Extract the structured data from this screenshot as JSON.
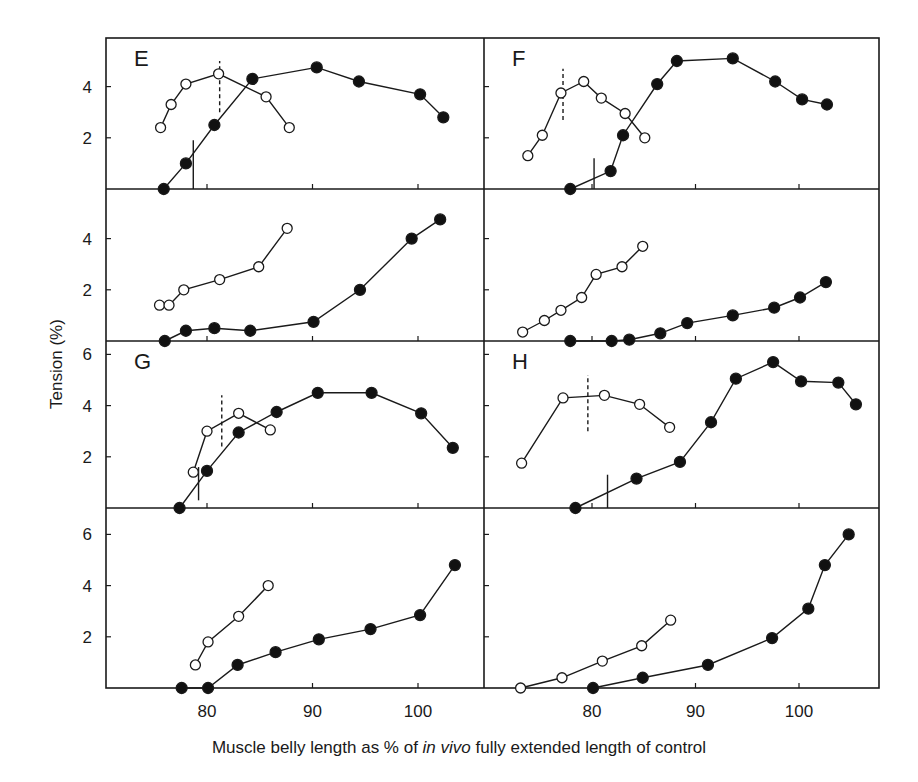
{
  "figure": {
    "ylabel": "Tension (%)",
    "xlabel_parts": [
      "Muscle belly length as % of ",
      "in vivo",
      " fully extended length of control"
    ],
    "x_ticks": [
      "80",
      "90",
      "100"
    ],
    "colors": {
      "ink": "#1a1a1a",
      "background": "#ffffff",
      "open_marker_fill": "#ffffff",
      "filled_marker_fill": "#111111"
    }
  },
  "chart_data": [
    {
      "type": "line",
      "panel": "E",
      "row": 1,
      "col": 1,
      "title": "E",
      "xlabel": "",
      "ylabel": "Tension (%)",
      "xlim": [
        70.5,
        106
      ],
      "ylim": [
        0,
        5.9
      ],
      "y_ticks": [
        2,
        4
      ],
      "x_ticks": [
        80,
        90,
        100
      ],
      "series": [
        {
          "name": "open",
          "marker": "open-circle",
          "x": [
            75.6,
            76.6,
            78.0,
            81.1,
            85.6,
            87.8
          ],
          "y": [
            2.4,
            3.3,
            4.1,
            4.5,
            3.6,
            2.4
          ]
        },
        {
          "name": "filled",
          "marker": "filled-circle",
          "x": [
            75.9,
            78.0,
            80.7,
            84.3,
            90.4,
            94.4,
            100.2,
            102.4
          ],
          "y": [
            0,
            1.0,
            2.5,
            4.3,
            4.75,
            4.2,
            3.7,
            2.8
          ]
        }
      ],
      "markers": [
        {
          "style": "solid",
          "x": 78.7,
          "y": [
            0.0,
            1.9
          ]
        },
        {
          "style": "dashed",
          "x": 81.2,
          "y": [
            3.0,
            5.0
          ]
        }
      ]
    },
    {
      "type": "line",
      "panel": "F",
      "row": 1,
      "col": 2,
      "title": "F",
      "xlabel": "",
      "ylabel": "",
      "xlim": [
        70.9,
        108.2
      ],
      "ylim": [
        0,
        5.9
      ],
      "y_ticks": [
        2,
        4
      ],
      "x_ticks": [
        80,
        90,
        100
      ],
      "series": [
        {
          "name": "open",
          "marker": "open-circle",
          "x": [
            73.8,
            75.2,
            77.0,
            79.2,
            80.9,
            83.2,
            85.1
          ],
          "y": [
            1.3,
            2.1,
            3.75,
            4.2,
            3.55,
            2.95,
            2.0
          ]
        },
        {
          "name": "filled",
          "marker": "filled-circle",
          "x": [
            77.9,
            81.8,
            83.0,
            86.3,
            88.2,
            93.6,
            97.7,
            100.3,
            102.7
          ],
          "y": [
            0,
            0.7,
            2.1,
            4.1,
            5.0,
            5.1,
            4.2,
            3.5,
            3.3
          ]
        }
      ],
      "markers": [
        {
          "style": "solid",
          "x": 80.2,
          "y": [
            0.0,
            1.2
          ]
        },
        {
          "style": "dashed",
          "x": 77.2,
          "y": [
            2.7,
            4.7
          ]
        }
      ]
    },
    {
      "type": "line",
      "panel": "E-lower",
      "row": 2,
      "col": 1,
      "title": "",
      "xlabel": "",
      "ylabel": "Tension (%)",
      "xlim": [
        70.5,
        106
      ],
      "ylim": [
        0,
        5.9
      ],
      "y_ticks": [
        2,
        4
      ],
      "x_ticks": [
        80,
        90,
        100
      ],
      "series": [
        {
          "name": "open",
          "marker": "open-circle",
          "x": [
            75.5,
            76.4,
            77.8,
            81.2,
            84.9,
            87.6
          ],
          "y": [
            1.4,
            1.4,
            2.0,
            2.4,
            2.9,
            4.4
          ]
        },
        {
          "name": "filled",
          "marker": "filled-circle",
          "x": [
            76.0,
            78.0,
            80.7,
            84.1,
            90.1,
            94.5,
            99.4,
            102.1
          ],
          "y": [
            0,
            0.4,
            0.5,
            0.4,
            0.75,
            2.0,
            4.0,
            4.75
          ]
        }
      ]
    },
    {
      "type": "line",
      "panel": "F-lower",
      "row": 2,
      "col": 2,
      "title": "",
      "xlabel": "",
      "ylabel": "",
      "xlim": [
        70.9,
        108.2
      ],
      "ylim": [
        0,
        5.9
      ],
      "y_ticks": [
        2,
        4
      ],
      "x_ticks": [
        80,
        90,
        100
      ],
      "series": [
        {
          "name": "open",
          "marker": "open-circle",
          "x": [
            73.3,
            75.4,
            77.0,
            79.0,
            80.4,
            82.9,
            84.9
          ],
          "y": [
            0.35,
            0.8,
            1.2,
            1.7,
            2.6,
            2.9,
            3.7
          ]
        },
        {
          "name": "filled",
          "marker": "filled-circle",
          "x": [
            77.9,
            81.9,
            83.6,
            86.6,
            89.2,
            93.6,
            97.6,
            100.1,
            102.6
          ],
          "y": [
            0,
            0,
            0.05,
            0.3,
            0.7,
            1.0,
            1.3,
            1.7,
            2.3
          ]
        }
      ]
    },
    {
      "type": "line",
      "panel": "G",
      "row": 3,
      "col": 1,
      "title": "G",
      "xlabel": "",
      "ylabel": "Tension (%)",
      "xlim": [
        70.5,
        106
      ],
      "ylim": [
        0,
        6.5
      ],
      "y_ticks": [
        2,
        4,
        6
      ],
      "x_ticks": [
        80,
        90,
        100
      ],
      "series": [
        {
          "name": "open",
          "marker": "open-circle",
          "x": [
            78.7,
            80.0,
            83.0,
            86.0
          ],
          "y": [
            1.4,
            3.0,
            3.7,
            3.05
          ]
        },
        {
          "name": "filled",
          "marker": "filled-circle",
          "x": [
            77.4,
            80.0,
            83.0,
            86.6,
            90.5,
            95.6,
            100.3,
            103.3
          ],
          "y": [
            0,
            1.45,
            2.95,
            3.75,
            4.5,
            4.5,
            3.7,
            2.35
          ]
        }
      ],
      "markers": [
        {
          "style": "solid",
          "x": 79.2,
          "y": [
            0.3,
            1.6
          ]
        },
        {
          "style": "dashed",
          "x": 81.4,
          "y": [
            2.4,
            4.4
          ]
        }
      ]
    },
    {
      "type": "line",
      "panel": "H",
      "row": 3,
      "col": 2,
      "title": "H",
      "xlabel": "",
      "ylabel": "",
      "xlim": [
        70.9,
        108.2
      ],
      "ylim": [
        0,
        6.5
      ],
      "y_ticks": [
        2,
        4,
        6
      ],
      "x_ticks": [
        80,
        90,
        100
      ],
      "series": [
        {
          "name": "open",
          "marker": "open-circle",
          "x": [
            73.2,
            77.2,
            81.2,
            84.6,
            87.5
          ],
          "y": [
            1.75,
            4.3,
            4.4,
            4.05,
            3.15
          ]
        },
        {
          "name": "filled",
          "marker": "filled-circle",
          "x": [
            78.4,
            84.3,
            88.5,
            91.5,
            93.9,
            97.5,
            100.2,
            103.8,
            105.5
          ],
          "y": [
            0,
            1.15,
            1.8,
            3.35,
            5.05,
            5.7,
            4.95,
            4.9,
            4.05
          ]
        }
      ],
      "markers": [
        {
          "style": "solid",
          "x": 81.5,
          "y": [
            0.0,
            1.3
          ]
        },
        {
          "style": "dashed",
          "x": 79.6,
          "y": [
            3.0,
            5.2
          ]
        }
      ]
    },
    {
      "type": "line",
      "panel": "G-lower",
      "row": 4,
      "col": 1,
      "title": "",
      "xlabel": "Muscle belly length as % of in vivo fully extended length of control",
      "ylabel": "Tension (%)",
      "xlim": [
        70.5,
        106
      ],
      "ylim": [
        0,
        7.0
      ],
      "y_ticks": [
        2,
        4,
        6
      ],
      "x_ticks": [
        80,
        90,
        100
      ],
      "series": [
        {
          "name": "open",
          "marker": "open-circle",
          "x": [
            78.9,
            80.1,
            83.0,
            85.8
          ],
          "y": [
            0.9,
            1.8,
            2.8,
            4.0
          ]
        },
        {
          "name": "filled",
          "marker": "filled-circle",
          "x": [
            77.6,
            80.1,
            82.9,
            86.5,
            90.6,
            95.5,
            100.2,
            103.5
          ],
          "y": [
            0,
            0,
            0.9,
            1.4,
            1.9,
            2.3,
            2.85,
            4.8
          ]
        }
      ]
    },
    {
      "type": "line",
      "panel": "H-lower",
      "row": 4,
      "col": 2,
      "title": "",
      "xlabel": "Muscle belly length as % of in vivo fully extended length of control",
      "ylabel": "",
      "xlim": [
        70.9,
        108.2
      ],
      "ylim": [
        0,
        7.0
      ],
      "y_ticks": [
        2,
        4,
        6
      ],
      "x_ticks": [
        80,
        90,
        100
      ],
      "series": [
        {
          "name": "open",
          "marker": "open-circle",
          "x": [
            73.1,
            77.1,
            81.0,
            84.8,
            87.6
          ],
          "y": [
            0,
            0.4,
            1.05,
            1.65,
            2.65
          ]
        },
        {
          "name": "filled",
          "marker": "filled-circle",
          "x": [
            80.1,
            84.9,
            91.2,
            97.4,
            100.9,
            102.5,
            104.8
          ],
          "y": [
            0,
            0.4,
            0.9,
            1.95,
            3.1,
            4.8,
            6.0
          ]
        }
      ]
    }
  ]
}
